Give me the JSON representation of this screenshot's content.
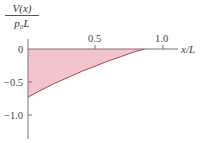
{
  "chart_data": {
    "type": "area",
    "title": "",
    "ylabel_numerator": "V(x)",
    "ylabel_denominator": "p₀L",
    "ylabel": "V(x)/p₀L",
    "xlabel": "x/L",
    "x_ticks": [
      "0.5",
      "1.0"
    ],
    "y_ticks": [
      "0",
      "−0.5",
      "−1.0"
    ],
    "xlim": [
      0,
      1.1
    ],
    "ylim": [
      -1.3,
      0.15
    ],
    "grid": false,
    "legend": null,
    "series": [
      {
        "name": "V(x)/p0L",
        "x": [
          0.0,
          0.1,
          0.2,
          0.3,
          0.4,
          0.5,
          0.6,
          0.7,
          0.8,
          0.87
        ],
        "values": [
          -0.73,
          -0.62,
          -0.52,
          -0.43,
          -0.34,
          -0.26,
          -0.18,
          -0.11,
          -0.04,
          0.0
        ]
      }
    ],
    "fill_color": "#f2c4cc",
    "line_color": "#c0394f",
    "axis_color": "#777777"
  }
}
